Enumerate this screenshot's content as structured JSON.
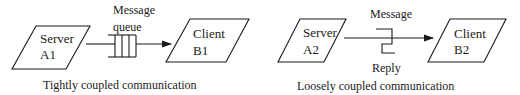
{
  "left_diagram": {
    "caption": "Tightly coupled communication",
    "source": {
      "line1": "Server",
      "line2": "A1"
    },
    "target": {
      "line1": "Client",
      "line2": "B1"
    },
    "channel_label_line1": "Message",
    "channel_label_line2": "queue",
    "channel_icon": "message-queue-icon"
  },
  "right_diagram": {
    "caption": "Loosely coupled communication",
    "source": {
      "line1": "Server",
      "line2": "A2"
    },
    "target": {
      "line1": "Client",
      "line2": "B2"
    },
    "message_label": "Message",
    "reply_label": "Reply",
    "channel_icon": "message-reply-bracket-icon"
  },
  "colors": {
    "stroke": "#1a1a1a",
    "background": "#ffffff"
  }
}
